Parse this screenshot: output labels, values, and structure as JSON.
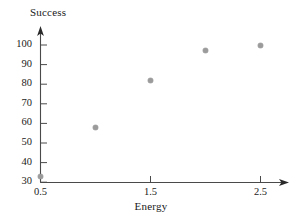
{
  "chart_data": {
    "type": "scatter",
    "title": "",
    "xlabel": "Energy",
    "ylabel": "Success",
    "x": [
      0.5,
      1.0,
      1.5,
      2.0,
      2.5
    ],
    "values": [
      33,
      58,
      82,
      97,
      100
    ],
    "points": [
      {
        "x": 0.5,
        "y": 33
      },
      {
        "x": 1.0,
        "y": 58
      },
      {
        "x": 1.5,
        "y": 82
      },
      {
        "x": 2.0,
        "y": 97
      },
      {
        "x": 2.5,
        "y": 100
      }
    ],
    "xlim": [
      0.5,
      2.72
    ],
    "ylim": [
      30,
      105
    ],
    "xticks": [
      0.5,
      1.5,
      2.5
    ],
    "xtick_labels": [
      "0.5",
      "1.5",
      "2.5"
    ],
    "yticks": [
      30,
      40,
      50,
      60,
      70,
      80,
      90,
      100
    ],
    "ytick_labels": [
      "30",
      "40",
      "50",
      "60",
      "70",
      "80",
      "90",
      "100"
    ],
    "grid": false,
    "legend": null,
    "marker_color": "#9b9b9b",
    "axis_color": "#4a4a4a",
    "axis_arrows": true,
    "background": "#ffffff"
  },
  "axes": {
    "y_title": "Success",
    "x_title": "Energy"
  },
  "ytick_labels": [
    "100",
    "90",
    "80",
    "70",
    "60",
    "50",
    "40",
    "30"
  ],
  "xtick_labels": [
    "0.5",
    "1.5",
    "2.5"
  ]
}
